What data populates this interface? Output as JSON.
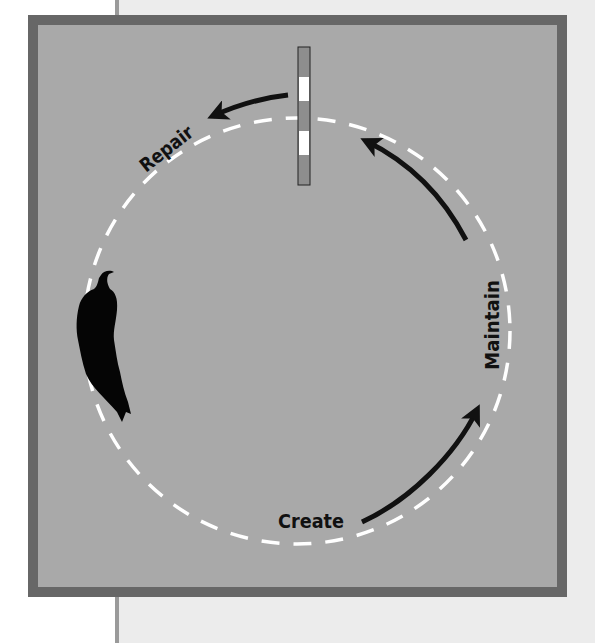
{
  "diagram": {
    "type": "cycle",
    "labels": {
      "create": "Create",
      "maintain": "Maintain",
      "repair": "Repair"
    },
    "stages": [
      "Create",
      "Maintain",
      "Repair"
    ],
    "direction": "counterclockwise",
    "icons": {
      "pole": "striped-pole-icon",
      "figure": "human-silhouette-icon"
    },
    "colors": {
      "frame_border": "#676767",
      "frame_fill": "#a9a9a9",
      "page_panel": "#ececec",
      "circle_dash": "#ffffff",
      "arrow": "#111111",
      "pole_stripe_light": "#ffffff",
      "pole_stripe_dark": "#8e8e8e"
    }
  }
}
